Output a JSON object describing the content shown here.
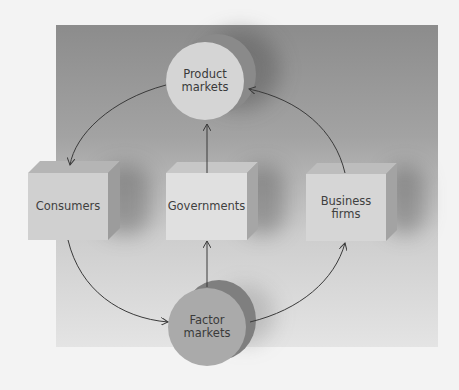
{
  "diagram": {
    "type": "circular-flow",
    "nodes": {
      "product_markets": {
        "label": "Product\nmarkets",
        "shape": "cylinder-disc"
      },
      "factor_markets": {
        "label": "Factor\nmarkets",
        "shape": "cylinder-disc"
      },
      "consumers": {
        "label": "Consumers",
        "shape": "box"
      },
      "governments": {
        "label": "Governments",
        "shape": "box"
      },
      "business_firms": {
        "label": "Business\nfirms",
        "shape": "box"
      }
    },
    "edges": [
      {
        "from": "product_markets",
        "to": "consumers"
      },
      {
        "from": "business_firms",
        "to": "product_markets"
      },
      {
        "from": "governments",
        "to": "product_markets"
      },
      {
        "from": "factor_markets",
        "to": "governments"
      },
      {
        "from": "consumers",
        "to": "factor_markets"
      },
      {
        "from": "factor_markets",
        "to": "business_firms"
      }
    ],
    "colors": {
      "page": "#f3f3f3",
      "panel_top": "#8c8c8c",
      "panel_bottom": "#e4e4e4",
      "product_face": "#d4d4d4",
      "factor_face": "#a9a9a9",
      "box_front": "#d2d2d2",
      "gov_front": "#e1e1e1",
      "arrow": "#3a3a3a"
    }
  }
}
